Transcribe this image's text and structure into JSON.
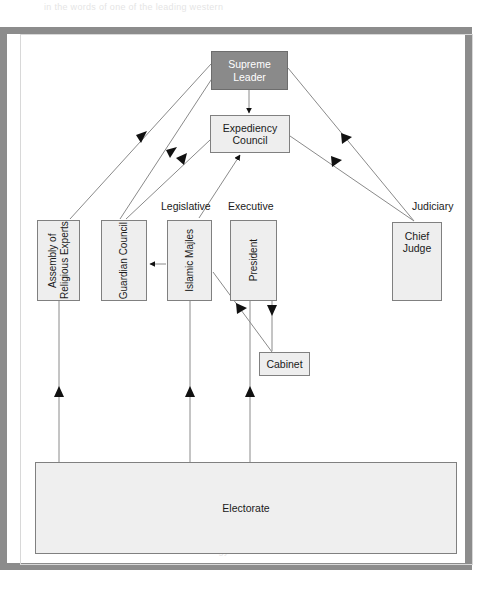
{
  "diagram": {
    "type": "org-chart",
    "nodes": [
      {
        "id": "supreme-leader",
        "label": "Supreme Leader",
        "style": "filled-gray",
        "orientation": "horizontal",
        "x": 211,
        "y": 51,
        "w": 77,
        "h": 39
      },
      {
        "id": "expediency-council",
        "label": "Expediency Council",
        "style": "light",
        "orientation": "horizontal",
        "x": 210,
        "y": 115,
        "w": 80,
        "h": 38
      },
      {
        "id": "assembly",
        "label": "Assembly of Religious Experts",
        "style": "light",
        "orientation": "vertical",
        "x": 37,
        "y": 220,
        "w": 43,
        "h": 81
      },
      {
        "id": "guardian-council",
        "label": "Guardian Council",
        "style": "light",
        "orientation": "vertical",
        "x": 101,
        "y": 220,
        "w": 46,
        "h": 81
      },
      {
        "id": "islamic-majles",
        "label": "Islamic Majles",
        "style": "light",
        "orientation": "vertical",
        "x": 167,
        "y": 220,
        "w": 45,
        "h": 81
      },
      {
        "id": "president",
        "label": "President",
        "style": "light",
        "orientation": "vertical",
        "x": 230,
        "y": 220,
        "w": 47,
        "h": 81
      },
      {
        "id": "chief-judge",
        "label": "Chief Judge",
        "style": "light",
        "orientation": "horizontal-top",
        "x": 392,
        "y": 222,
        "w": 50,
        "h": 79
      },
      {
        "id": "cabinet",
        "label": "Cabinet",
        "style": "light",
        "orientation": "horizontal",
        "x": 259,
        "y": 352,
        "w": 51,
        "h": 24
      },
      {
        "id": "electorate",
        "label": "Electorate",
        "style": "light",
        "orientation": "horizontal",
        "x": 35,
        "y": 462,
        "w": 422,
        "h": 92
      }
    ],
    "branch_labels": [
      {
        "id": "legislative",
        "label": "Legislative",
        "x": 161,
        "y": 200
      },
      {
        "id": "executive",
        "label": "Executive",
        "x": 228,
        "y": 200
      },
      {
        "id": "judiciary",
        "label": "Judiciary",
        "x": 412,
        "y": 200
      }
    ],
    "edges": [
      {
        "from": "supreme-leader",
        "to": "expediency-council",
        "label": ""
      },
      {
        "from": "supreme-leader",
        "to": "assembly",
        "label": ""
      },
      {
        "from": "supreme-leader",
        "to": "guardian-council",
        "label": ""
      },
      {
        "from": "supreme-leader",
        "to": "chief-judge",
        "label": ""
      },
      {
        "from": "expediency-council",
        "to": "chief-judge",
        "label": ""
      },
      {
        "from": "guardian-council",
        "to": "expediency-council",
        "label": ""
      },
      {
        "from": "islamic-majles",
        "to": "expediency-council",
        "label": ""
      },
      {
        "from": "islamic-majles",
        "to": "guardian-council",
        "label": ""
      },
      {
        "from": "islamic-majles",
        "to": "cabinet",
        "label": ""
      },
      {
        "from": "president",
        "to": "cabinet",
        "label": ""
      },
      {
        "from": "electorate",
        "to": "assembly",
        "label": ""
      },
      {
        "from": "electorate",
        "to": "islamic-majles",
        "label": ""
      },
      {
        "from": "electorate",
        "to": "president",
        "label": ""
      }
    ],
    "colors": {
      "frame": "#8c8c8c",
      "node_fill": "#eeeeee",
      "node_fill_accent": "#8a8a8a",
      "node_border": "#808080",
      "line": "#8a8a8a",
      "text": "#1a1a1a",
      "text_on_accent": "#ffffff"
    }
  },
  "ghost_text": {
    "line1": "in the words of one of the leading western",
    "line2": "in Iran is a figure who knows no equivalent",
    "line3": "republican order built around elected",
    "line4": "ambiguity of the relation of the religious",
    "line5": "of the state and of the role of the clergy"
  }
}
